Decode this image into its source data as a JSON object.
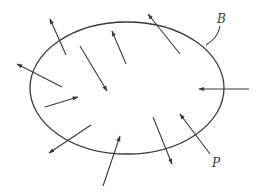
{
  "diagram": {
    "labels": {
      "boundary": "B",
      "point": "P"
    },
    "colors": {
      "stroke": "#3a3a3a",
      "background": "#ffffff"
    },
    "vectors": [
      {
        "id": "v1",
        "direction": "outward",
        "crosses_boundary": true
      },
      {
        "id": "v2",
        "direction": "outward",
        "crosses_boundary": true
      },
      {
        "id": "v3",
        "direction": "interior",
        "crosses_boundary": false
      },
      {
        "id": "v4",
        "direction": "interior",
        "crosses_boundary": false
      },
      {
        "id": "v5",
        "direction": "outward",
        "crosses_boundary": true
      },
      {
        "id": "v6",
        "direction": "inward",
        "crosses_boundary": true
      },
      {
        "id": "v7",
        "direction": "interior",
        "crosses_boundary": false
      },
      {
        "id": "v8",
        "direction": "outward",
        "crosses_boundary": true
      },
      {
        "id": "v9",
        "direction": "inward",
        "crosses_boundary": true
      },
      {
        "id": "v10",
        "direction": "outward",
        "crosses_boundary": true
      },
      {
        "id": "v11",
        "direction": "inward",
        "crosses_boundary": true,
        "label": "P"
      }
    ]
  }
}
